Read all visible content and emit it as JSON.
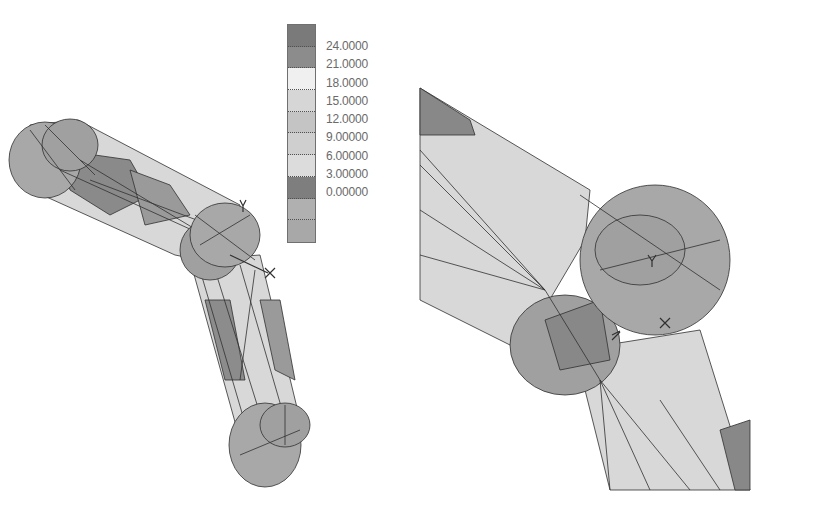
{
  "figure": {
    "left_view": "full linkage model with contour mesh",
    "right_view": "zoomed joint region with contour mesh"
  },
  "legend": {
    "values": [
      "24.0000",
      "21.0000",
      "18.0000",
      "15.0000",
      "12.0000",
      "9.00000",
      "6.00000",
      "3.00000",
      "0.00000"
    ],
    "band_colors": [
      "#7a7a7a",
      "#8c8c8c",
      "#f0f0f0",
      "#d6d6d6",
      "#c4c4c4",
      "#cfcfcf",
      "#dcdcdc",
      "#7e7e7e",
      "#b0b0b0",
      "#a8a8a8"
    ]
  },
  "axes_left": {
    "x": "X",
    "y": "Y",
    "z": "Z"
  },
  "axes_right": {
    "x": "X",
    "y": "Y",
    "z": "Z"
  },
  "colors": {
    "light_fill": "#d8d8d8",
    "mid_fill": "#a8a8a8",
    "dark_fill": "#888888",
    "mesh_line": "#303030"
  }
}
